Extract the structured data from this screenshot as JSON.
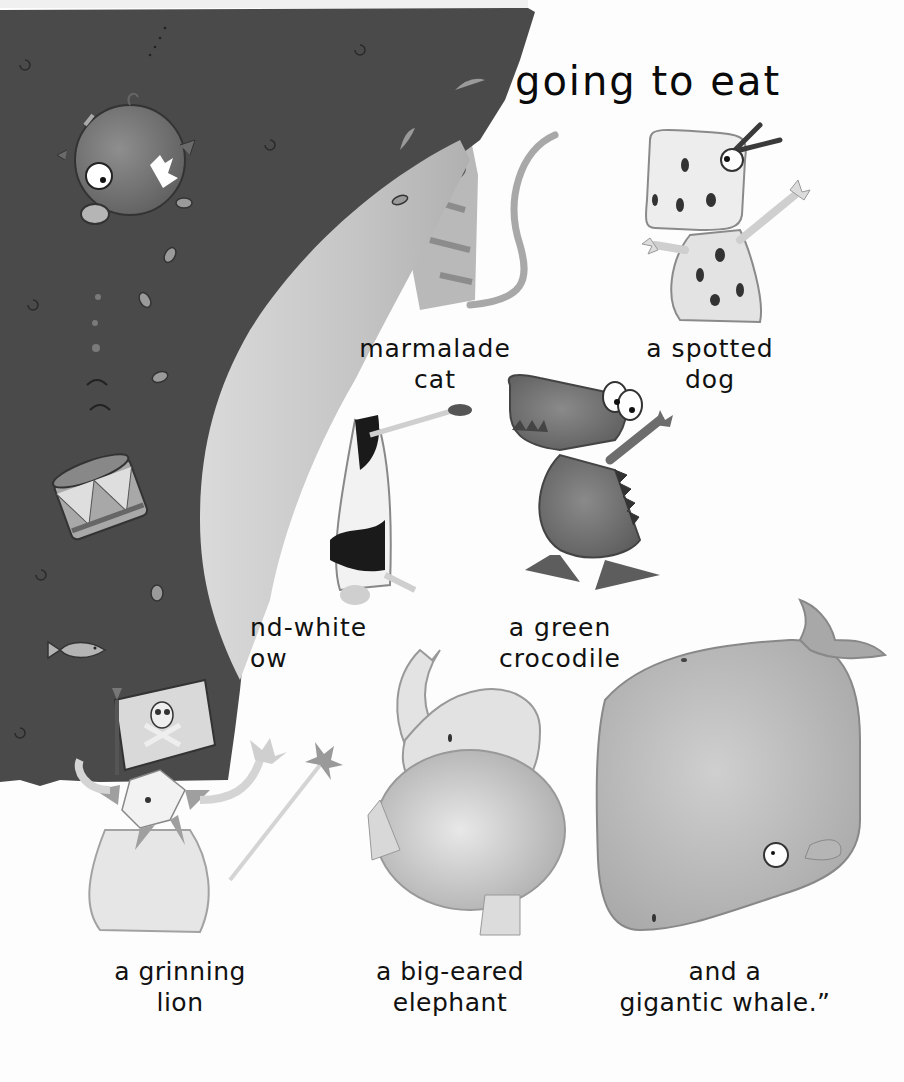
{
  "page": {
    "type": "picture-book-spread",
    "heading": "going to eat",
    "colors": {
      "torn_page_background": "#4a4a4a",
      "curled_page": "#c9c9c9",
      "paper": "#fdfdfd",
      "text": "#111111"
    }
  },
  "captions": {
    "cat": {
      "line1": "marmalade",
      "line2": "cat"
    },
    "dog": {
      "line1": "a spotted",
      "line2": "dog"
    },
    "cow": {
      "line1": "nd-white",
      "line2": "ow"
    },
    "crocodile": {
      "line1": "a green",
      "line2": "crocodile"
    },
    "lion": {
      "line1": "a grinning",
      "line2": "lion"
    },
    "elephant": {
      "line1": "a big-eared",
      "line2": "elephant"
    },
    "whale": {
      "line1": "and a",
      "line2": "gigantic whale.”"
    }
  },
  "illustrations": {
    "left_torn_page": [
      "pig",
      "drum",
      "fish",
      "pirate-flag",
      "coins",
      "bubbles",
      "swirls"
    ],
    "right_page": [
      "marmalade-cat",
      "spotted-dog",
      "cow",
      "green-crocodile",
      "grinning-lion",
      "big-eared-elephant",
      "gigantic-whale"
    ]
  }
}
